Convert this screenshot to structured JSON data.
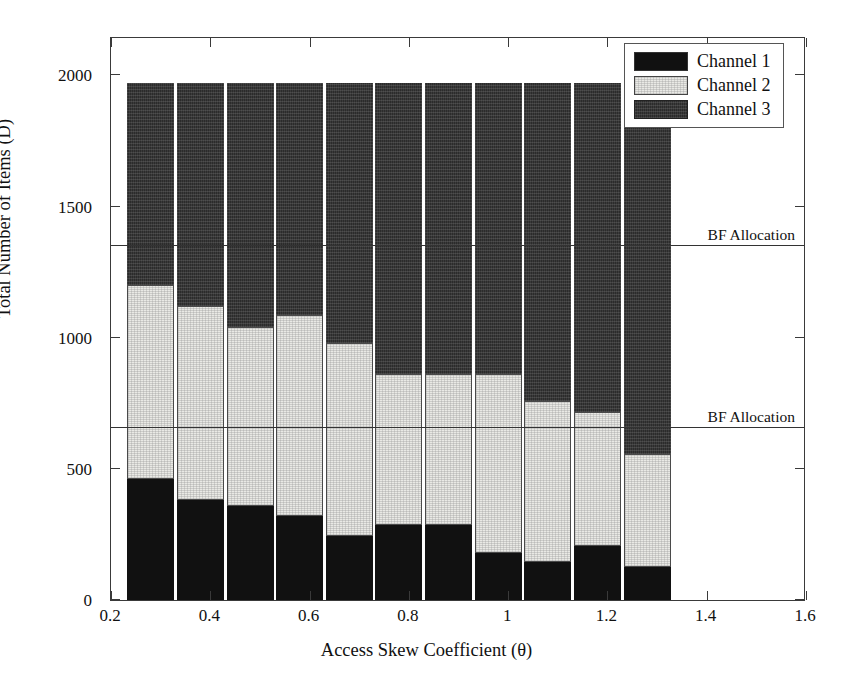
{
  "chart_data": {
    "type": "bar",
    "subtype": "stacked-vertical",
    "title": "",
    "xlabel": "Access Skew Coefficient (θ)",
    "ylabel": "Total Number of Items (D)",
    "xlim": [
      0.2,
      1.6
    ],
    "ylim": [
      0,
      2150
    ],
    "grid": false,
    "legend_position": "top-right",
    "xticks": [
      "0.2",
      "0.4",
      "0.6",
      "0.8",
      "1",
      "1.2",
      "1.4",
      "1.6"
    ],
    "xtick_values": [
      0.2,
      0.4,
      0.6,
      0.8,
      1.0,
      1.2,
      1.4,
      1.6
    ],
    "yticks": [
      "0",
      "500",
      "1000",
      "1500",
      "2000"
    ],
    "ytick_values": [
      0,
      500,
      1000,
      1500,
      2000
    ],
    "x": [
      0.28,
      0.38,
      0.48,
      0.58,
      0.68,
      0.78,
      0.88,
      0.98,
      1.08,
      1.18,
      1.28
    ],
    "categories": [
      "0.28",
      "0.38",
      "0.48",
      "0.58",
      "0.68",
      "0.78",
      "0.88",
      "0.98",
      "1.08",
      "1.18",
      "1.28"
    ],
    "series": [
      {
        "name": "Channel 1",
        "color": "#111111",
        "values": [
          460,
          380,
          360,
          320,
          245,
          285,
          285,
          180,
          145,
          205,
          125
        ]
      },
      {
        "name": "Channel 2",
        "color": "#e9e9e5",
        "values": [
          740,
          740,
          680,
          765,
          735,
          575,
          575,
          680,
          615,
          510,
          430
        ]
      },
      {
        "name": "Channel 3",
        "color": "#2b2b2b",
        "values": [
          770,
          850,
          930,
          885,
          990,
          1110,
          1110,
          1110,
          1210,
          1255,
          1415
        ]
      }
    ],
    "totals": [
      1970,
      1970,
      1970,
      1970,
      1970,
      1970,
      1970,
      1970,
      1970,
      1970,
      1970
    ],
    "annotations": [
      {
        "label": "BF Allocation",
        "type": "hline",
        "y": 1350
      },
      {
        "label": "BF Allocation",
        "type": "hline",
        "y": 655
      }
    ]
  },
  "legend": {
    "items": [
      {
        "label": "Channel 1",
        "swatch": "ch1"
      },
      {
        "label": "Channel 2",
        "swatch": "ch2"
      },
      {
        "label": "Channel 3",
        "swatch": "ch3"
      }
    ]
  }
}
